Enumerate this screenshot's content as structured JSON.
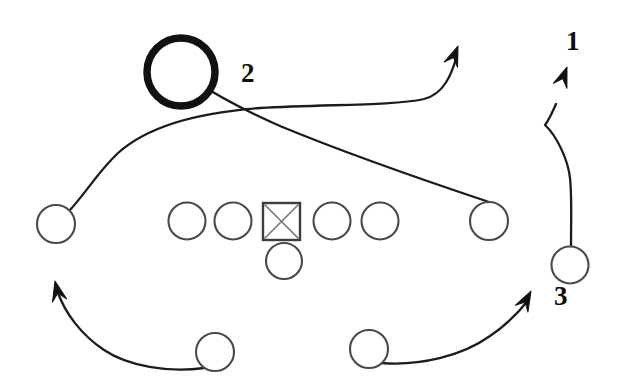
{
  "diagram": {
    "kind": "american-football-play-diagram",
    "title": "",
    "background_color": "#ffffff",
    "ink_color": "#1c1c1c",
    "width": 623,
    "height": 391,
    "route_labels": [
      {
        "id": "label-1",
        "text": "1",
        "x": 566,
        "y": 50
      },
      {
        "id": "label-2",
        "text": "2",
        "x": 241,
        "y": 82
      },
      {
        "id": "label-3",
        "text": "3",
        "x": 554,
        "y": 305
      }
    ],
    "players": [
      {
        "id": "left-wide-receiver",
        "shape": "circle",
        "cx": 56,
        "cy": 224,
        "r": 19,
        "style": "normal"
      },
      {
        "id": "left-tackle",
        "shape": "circle",
        "cx": 187,
        "cy": 221,
        "r": 18.5,
        "style": "normal"
      },
      {
        "id": "left-guard",
        "shape": "circle",
        "cx": 233,
        "cy": 221,
        "r": 18.5,
        "style": "normal"
      },
      {
        "id": "center",
        "shape": "square",
        "x": 263,
        "y": 203,
        "size": 37,
        "style": "normal"
      },
      {
        "id": "right-guard",
        "shape": "circle",
        "cx": 332,
        "cy": 221,
        "r": 18.5,
        "style": "normal"
      },
      {
        "id": "right-tackle",
        "shape": "circle",
        "cx": 380,
        "cy": 221,
        "r": 18.5,
        "style": "normal"
      },
      {
        "id": "slot-receiver-right",
        "shape": "circle",
        "cx": 489,
        "cy": 221,
        "r": 19,
        "style": "normal"
      },
      {
        "id": "quarterback",
        "shape": "circle",
        "cx": 284,
        "cy": 261,
        "r": 18,
        "style": "normal"
      },
      {
        "id": "running-back-left",
        "shape": "circle",
        "cx": 215,
        "cy": 352,
        "r": 19,
        "style": "normal"
      },
      {
        "id": "running-back-right",
        "shape": "circle",
        "cx": 369,
        "cy": 349,
        "r": 19,
        "style": "normal"
      },
      {
        "id": "flanker-right",
        "shape": "circle",
        "cx": 570,
        "cy": 265,
        "r": 18.5,
        "style": "normal"
      },
      {
        "id": "ball-target",
        "shape": "circle",
        "cx": 181,
        "cy": 72,
        "r": 34,
        "style": "bold"
      }
    ],
    "routes": [
      {
        "id": "route-left-receiver-deep",
        "from": "left-wide-receiver",
        "path": "M 70 210 C 88 190 98 172 118 153 C 150 124 205 112 260 108 C 330 104 392 106 424 99 C 444 94 452 74 457 55",
        "arrow": {
          "tip_x": 458,
          "tip_y": 46,
          "angle": -69
        }
      },
      {
        "id": "route-slot-receiver-cross",
        "from": "slot-receiver-right",
        "path": "M 492 203 C 450 189 350 155 280 126 C 245 111 210 91 188 77",
        "arrow": {
          "tip_x": 178,
          "tip_y": 62,
          "angle": -148
        }
      },
      {
        "id": "route-flanker-3-up",
        "from": "flanker-right",
        "path": "M 571 246 C 571 222 572 196 570 178 C 568 160 557 136 545 125 C 549 120 552 113 556 104",
        "arrow": {
          "tip_x": 567,
          "tip_y": 67,
          "angle": -70
        }
      },
      {
        "id": "route-running-back-left-sweep",
        "from": "running-back-left",
        "path": "M 204 368 C 168 373 128 366 104 350 C 80 334 65 312 58 293",
        "arrow": {
          "tip_x": 55,
          "tip_y": 281,
          "angle": -103
        }
      },
      {
        "id": "route-running-back-right-sweep",
        "from": "running-back-right",
        "path": "M 381 363 C 420 366 462 356 490 336 C 512 321 523 307 529 299",
        "arrow": {
          "tip_x": 531,
          "tip_y": 291,
          "angle": -62
        }
      }
    ]
  }
}
